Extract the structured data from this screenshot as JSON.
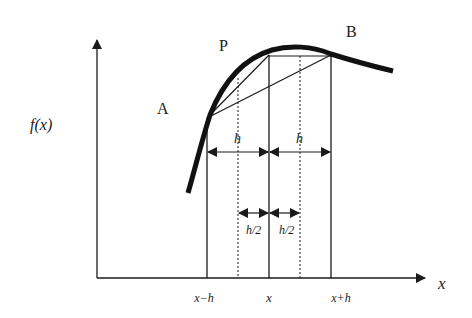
{
  "diagram": {
    "labels": {
      "point_a": "A",
      "point_p": "P",
      "point_b": "B",
      "y_axis": "f(x)",
      "x_axis": "x",
      "step_left": "h",
      "step_right": "h",
      "half_step_left": "h/2",
      "half_step_right": "h/2"
    },
    "ticks": [
      "x−h",
      "x",
      "x+h"
    ],
    "colors": {
      "stroke": "#1a1a1a",
      "background": "#ffffff"
    }
  }
}
